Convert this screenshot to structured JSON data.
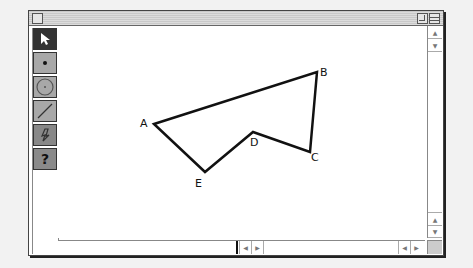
{
  "window": {
    "title": ""
  },
  "palette": {
    "tools": [
      {
        "name": "arrow",
        "icon": "arrow-pointer-icon",
        "selected": true
      },
      {
        "name": "point",
        "icon": "point-icon",
        "selected": false
      },
      {
        "name": "compass",
        "icon": "circle-icon",
        "selected": false
      },
      {
        "name": "straightedge",
        "icon": "line-segment-icon",
        "selected": false
      },
      {
        "name": "custom",
        "icon": "custom-tool-icon",
        "selected": false
      },
      {
        "name": "help",
        "icon": "question-icon",
        "label": "?",
        "selected": false
      }
    ]
  },
  "figure": {
    "points": [
      {
        "label": "A",
        "x": 154,
        "y": 123
      },
      {
        "label": "B",
        "x": 317,
        "y": 71
      },
      {
        "label": "C",
        "x": 310,
        "y": 151
      },
      {
        "label": "D",
        "x": 253,
        "y": 131
      },
      {
        "label": "E",
        "x": 205,
        "y": 171
      }
    ],
    "polygon_order": [
      "A",
      "B",
      "C",
      "D",
      "E"
    ]
  },
  "scrollbars": {
    "up": "▲",
    "down": "▼",
    "left": "◀",
    "right": "▶"
  }
}
